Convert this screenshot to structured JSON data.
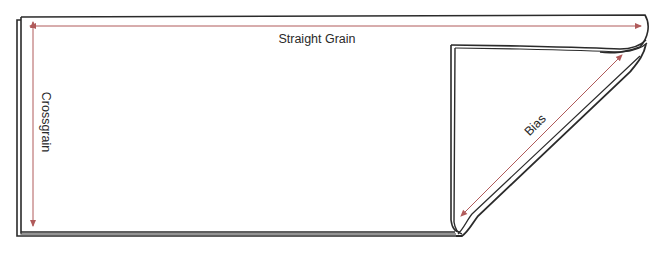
{
  "diagram": {
    "labels": {
      "straight_grain": "Straight Grain",
      "crossgrain": "Crossgrain",
      "bias": "Bias"
    },
    "colors": {
      "outline": "#2b2b2b",
      "arrow": "#b05a5a",
      "text": "#2a2a2a",
      "background": "#ffffff"
    }
  }
}
